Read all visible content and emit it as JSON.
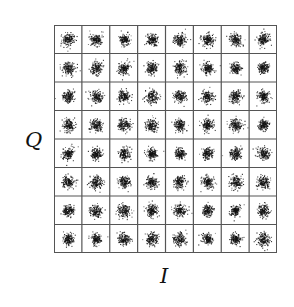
{
  "diagram": {
    "type": "constellation",
    "modulation_grid": {
      "rows": 8,
      "cols": 8
    },
    "axis_labels": {
      "vertical": "Q",
      "horizontal": "I"
    },
    "colors": {
      "grid_line": "#555555",
      "points": "#111111",
      "background": "#ffffff"
    }
  },
  "chart_data": {
    "type": "scatter",
    "title": "",
    "xlabel": "I",
    "ylabel": "Q",
    "grid": true,
    "cluster_centers_x": [
      -7,
      -5,
      -3,
      -1,
      1,
      3,
      5,
      7
    ],
    "cluster_centers_y": [
      -7,
      -5,
      -3,
      -1,
      1,
      3,
      5,
      7
    ],
    "points_per_cluster": 160
  }
}
